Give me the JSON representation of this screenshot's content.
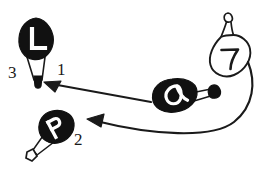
{
  "figure": {
    "background_color": "#ffffff",
    "ink_color": "#1a1a1a",
    "fill_white": "#ffffff"
  },
  "objects": [
    {
      "id": "vessel-l",
      "name": "labelled-vessel-l",
      "glyph": "L",
      "glyph_color": "#ffffff",
      "body_color": "#111111",
      "position": "top-left",
      "has_funnel": true,
      "funnel_tip": "filled"
    },
    {
      "id": "vessel-p",
      "name": "labelled-vessel-p",
      "glyph": "P",
      "glyph_color": "#ffffff",
      "body_color": "#111111",
      "position": "bottom-left",
      "has_funnel": true,
      "funnel_tip": "open"
    },
    {
      "id": "vessel-alpha",
      "name": "labelled-vessel-alpha",
      "glyph": "α",
      "glyph_color": "#ffffff",
      "body_color": "#111111",
      "position": "middle-right",
      "has_funnel": true,
      "funnel_tip": "filled"
    },
    {
      "id": "vessel-seven",
      "name": "labelled-vessel-seven",
      "glyph": "7",
      "glyph_color": "#1a1a1a",
      "body_color": "#ffffff",
      "position": "top-right",
      "has_funnel": false,
      "funnel_tip": "none"
    }
  ],
  "step_labels": [
    {
      "id": "step-1",
      "text": "1",
      "x": 57,
      "y": 75
    },
    {
      "id": "step-2",
      "text": "2",
      "x": 74,
      "y": 145
    },
    {
      "id": "step-3",
      "text": "3",
      "x": 8,
      "y": 78
    }
  ],
  "arrows": [
    {
      "id": "arrow-1",
      "name": "arrow-alpha-to-l",
      "from": "vessel-alpha",
      "to": "vessel-l",
      "step": "1",
      "style": "straight"
    },
    {
      "id": "arrow-2",
      "name": "arrow-seven-to-p",
      "from": "vessel-seven",
      "to": "vessel-p",
      "step": "2",
      "style": "curved"
    }
  ]
}
